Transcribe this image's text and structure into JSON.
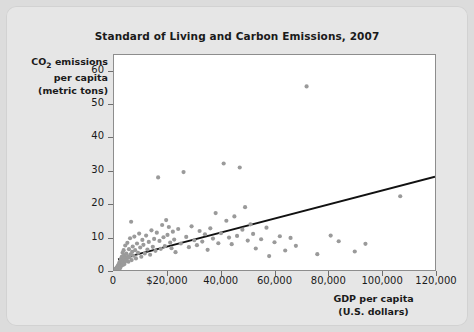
{
  "chart_data": {
    "type": "scatter",
    "title": "Standard of Living and Carbon Emissions, 2007",
    "xlabel_line1": "GDP per capita",
    "xlabel_line2": "(U.S. dollars)",
    "ylabel_line1_pre": "CO",
    "ylabel_line1_sub": "2",
    "ylabel_line1_post": " emissions",
    "ylabel_line2": "per capita",
    "ylabel_line3": "(metric tons)",
    "xlim": [
      0,
      120000
    ],
    "ylim": [
      0,
      65
    ],
    "xticks": [
      0,
      20000,
      40000,
      60000,
      80000,
      100000,
      120000
    ],
    "xtick_labels": [
      "0",
      "$20,000",
      "40,000",
      "60,000",
      "80,000",
      "100,000",
      "120,000"
    ],
    "yticks": [
      0,
      10,
      20,
      30,
      40,
      50,
      60
    ],
    "ytick_labels": [
      "0",
      "10",
      "20",
      "30",
      "40",
      "50",
      "60"
    ],
    "grid": false,
    "legend": "none",
    "point_color": "#9a9a9a",
    "point_radius": 2.1,
    "trendline": {
      "color": "#111111",
      "width": 1.8,
      "x": [
        1500,
        120000
      ],
      "y": [
        3.2,
        28.2
      ]
    },
    "points": [
      [
        600,
        0.3
      ],
      [
        700,
        0.2
      ],
      [
        800,
        0.5
      ],
      [
        900,
        0.4
      ],
      [
        1000,
        0.6
      ],
      [
        1100,
        0.8
      ],
      [
        1200,
        0.3
      ],
      [
        1300,
        1.0
      ],
      [
        1400,
        0.5
      ],
      [
        1500,
        1.3
      ],
      [
        1600,
        0.7
      ],
      [
        1700,
        1.6
      ],
      [
        1800,
        0.9
      ],
      [
        1900,
        2.0
      ],
      [
        2000,
        1.1
      ],
      [
        2100,
        2.4
      ],
      [
        2200,
        1.4
      ],
      [
        2300,
        0.6
      ],
      [
        2400,
        2.8
      ],
      [
        2500,
        1.7
      ],
      [
        2600,
        3.4
      ],
      [
        2700,
        1.2
      ],
      [
        2800,
        2.1
      ],
      [
        2900,
        4.0
      ],
      [
        3000,
        1.9
      ],
      [
        3100,
        2.6
      ],
      [
        3200,
        5.2
      ],
      [
        3300,
        1.5
      ],
      [
        3400,
        3.1
      ],
      [
        3500,
        2.3
      ],
      [
        3600,
        6.0
      ],
      [
        3700,
        2.9
      ],
      [
        3800,
        4.4
      ],
      [
        3900,
        1.8
      ],
      [
        4000,
        3.6
      ],
      [
        4200,
        7.4
      ],
      [
        4400,
        2.7
      ],
      [
        4600,
        5.0
      ],
      [
        4800,
        3.3
      ],
      [
        5000,
        8.2
      ],
      [
        5200,
        4.1
      ],
      [
        5400,
        2.5
      ],
      [
        5600,
        6.3
      ],
      [
        5800,
        3.8
      ],
      [
        6000,
        9.6
      ],
      [
        6200,
        4.7
      ],
      [
        6400,
        14.6
      ],
      [
        6600,
        3.0
      ],
      [
        6800,
        5.5
      ],
      [
        7000,
        7.1
      ],
      [
        7300,
        4.3
      ],
      [
        7600,
        10.1
      ],
      [
        7900,
        6.0
      ],
      [
        8200,
        3.5
      ],
      [
        8600,
        8.0
      ],
      [
        9000,
        5.2
      ],
      [
        9400,
        11.0
      ],
      [
        9800,
        6.8
      ],
      [
        10200,
        4.0
      ],
      [
        10600,
        9.1
      ],
      [
        11000,
        7.6
      ],
      [
        11500,
        5.0
      ],
      [
        12000,
        10.4
      ],
      [
        12500,
        6.2
      ],
      [
        13000,
        8.5
      ],
      [
        13500,
        4.6
      ],
      [
        14000,
        12.0
      ],
      [
        14500,
        7.0
      ],
      [
        15000,
        9.4
      ],
      [
        15500,
        5.8
      ],
      [
        16000,
        11.3
      ],
      [
        16500,
        28.0
      ],
      [
        17000,
        8.8
      ],
      [
        17500,
        6.4
      ],
      [
        18000,
        13.6
      ],
      [
        18500,
        9.9
      ],
      [
        19000,
        7.2
      ],
      [
        19500,
        15.1
      ],
      [
        20000,
        10.6
      ],
      [
        20500,
        13.0
      ],
      [
        21000,
        8.3
      ],
      [
        21500,
        6.6
      ],
      [
        22000,
        11.6
      ],
      [
        22500,
        9.2
      ],
      [
        23000,
        5.4
      ],
      [
        24000,
        12.4
      ],
      [
        25000,
        8.0
      ],
      [
        26000,
        29.6
      ],
      [
        27000,
        10.0
      ],
      [
        28000,
        6.9
      ],
      [
        29000,
        13.2
      ],
      [
        30000,
        9.0
      ],
      [
        31000,
        7.5
      ],
      [
        32000,
        11.8
      ],
      [
        33000,
        8.6
      ],
      [
        34000,
        10.8
      ],
      [
        35000,
        6.1
      ],
      [
        36000,
        12.6
      ],
      [
        37000,
        9.5
      ],
      [
        38000,
        17.2
      ],
      [
        39000,
        8.1
      ],
      [
        40000,
        11.1
      ],
      [
        41000,
        32.2
      ],
      [
        42000,
        14.9
      ],
      [
        43000,
        9.8
      ],
      [
        44000,
        7.8
      ],
      [
        45000,
        16.2
      ],
      [
        46000,
        10.3
      ],
      [
        47000,
        31.0
      ],
      [
        48000,
        12.2
      ],
      [
        49000,
        19.0
      ],
      [
        50000,
        8.9
      ],
      [
        51000,
        13.8
      ],
      [
        52000,
        10.9
      ],
      [
        53000,
        6.5
      ],
      [
        55000,
        9.3
      ],
      [
        57000,
        12.8
      ],
      [
        58000,
        4.2
      ],
      [
        60000,
        8.4
      ],
      [
        62000,
        10.2
      ],
      [
        64000,
        5.9
      ],
      [
        66000,
        9.7
      ],
      [
        68000,
        7.3
      ],
      [
        72000,
        55.5
      ],
      [
        76000,
        4.8
      ],
      [
        81000,
        10.4
      ],
      [
        84000,
        8.7
      ],
      [
        90000,
        5.6
      ],
      [
        94000,
        7.9
      ],
      [
        107000,
        22.3
      ]
    ]
  }
}
